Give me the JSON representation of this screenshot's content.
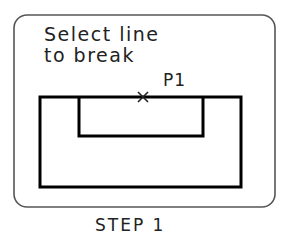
{
  "panel": {
    "prompt_line1": "Select line",
    "prompt_line2": "to break",
    "point_label": "P1",
    "caption": "STEP 1"
  },
  "colors": {
    "frame": "#555555",
    "geometry": "#000000",
    "text": "#222222",
    "background": "#ffffff"
  }
}
